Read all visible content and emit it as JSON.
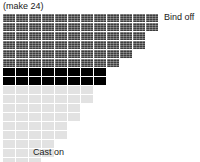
{
  "header": {
    "text": "(make 24)"
  },
  "footer": {
    "text": "Cast on"
  },
  "labels": {
    "bind_off": "Bind off",
    "cast_on": "Cast on"
  },
  "colors": {
    "dark_cell": "#3d3d3d",
    "black_cell": "#000000",
    "light_cell": "#e2e2e2",
    "text": "#1a1a1a",
    "background": "#ffffff"
  },
  "chart_data": {
    "type": "table",
    "title": "(make 24)",
    "cell_types": [
      "dark",
      "black",
      "light"
    ],
    "rows": [
      {
        "count": 12,
        "style": "dark",
        "label": "Bind off"
      },
      {
        "count": 12,
        "style": "dark",
        "label": ""
      },
      {
        "count": 11,
        "style": "dark",
        "label": ""
      },
      {
        "count": 11,
        "style": "dark",
        "label": ""
      },
      {
        "count": 10,
        "style": "dark",
        "label": ""
      },
      {
        "count": 9,
        "style": "dark",
        "label": ""
      },
      {
        "count": 8,
        "style": "black",
        "label": ""
      },
      {
        "count": 8,
        "style": "black",
        "label": ""
      },
      {
        "count": 7,
        "style": "light",
        "label": ""
      },
      {
        "count": 7,
        "style": "light",
        "label": ""
      },
      {
        "count": 6,
        "style": "light",
        "label": ""
      },
      {
        "count": 6,
        "style": "light",
        "label": ""
      },
      {
        "count": 5,
        "style": "light",
        "label": ""
      },
      {
        "count": 5,
        "style": "light",
        "label": ""
      },
      {
        "count": 4,
        "style": "light",
        "label": ""
      },
      {
        "count": 4,
        "style": "light",
        "label": ""
      },
      {
        "count": 3,
        "style": "light",
        "label": ""
      },
      {
        "count": 3,
        "style": "light",
        "label": ""
      },
      {
        "count": 3,
        "style": "light",
        "label": ""
      },
      {
        "count": 2,
        "style": "light",
        "label": ""
      },
      {
        "count": 2,
        "style": "light",
        "label": ""
      },
      {
        "count": 2,
        "style": "light",
        "label": "Cast on"
      }
    ]
  }
}
